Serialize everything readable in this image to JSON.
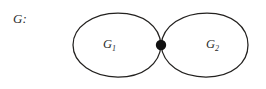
{
  "figure": {
    "name": "graph-with-cut-vertex",
    "background_color": "#ffffff",
    "stroke_color": "#23211f",
    "text_color": "#2b2b2b",
    "vertex_color": "#111111",
    "width": 266,
    "height": 89
  },
  "labels": {
    "graph_name": "G:",
    "left_block_base": "G",
    "left_block_index": "1",
    "right_block_base": "G",
    "right_block_index": "2"
  },
  "geometry": {
    "left_loop": {
      "left_x": 73,
      "right_x": 161,
      "top_y": 13,
      "bottom_y": 77,
      "label_center_x": 111,
      "label_center_y": 48
    },
    "right_loop": {
      "left_x": 161,
      "right_x": 248,
      "top_y": 13,
      "bottom_y": 77,
      "label_center_x": 214,
      "label_center_y": 48
    },
    "cut_vertex": {
      "cx": 161,
      "cy": 45,
      "r": 5.2
    },
    "graph_name_position": {
      "x": 13,
      "y": 23
    }
  }
}
